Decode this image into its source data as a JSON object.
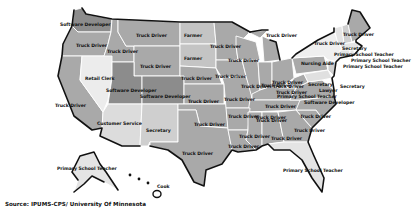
{
  "map": {
    "title": "",
    "type": "choropleth",
    "region": "United States",
    "colors": {
      "truck_driver": "#a9a9a9",
      "software_developer": "#8c8c8c",
      "farmer": "#c4c4c4",
      "retail_clerk": "#ececec",
      "customer_service": "#dcdcdc",
      "secretary": "#cfcfcf",
      "primary_school_teacher": "#e4e4e4",
      "nursing_aide": "#efefef",
      "cook": "#ffffff",
      "lawyer": "#e0e0e0",
      "background": "#ffffff",
      "coastline": "#111111"
    },
    "labels": [
      {
        "state": "Washington",
        "text": "Software Developer"
      },
      {
        "state": "Oregon",
        "text": "Truck Driver"
      },
      {
        "state": "Idaho",
        "text": "Truck Driver"
      },
      {
        "state": "Montana",
        "text": "Truck Driver"
      },
      {
        "state": "North Dakota",
        "text": "Farmer"
      },
      {
        "state": "South Dakota",
        "text": "Farmer"
      },
      {
        "state": "Minnesota",
        "text": "Truck Driver"
      },
      {
        "state": "Wisconsin",
        "text": "Truck Driver"
      },
      {
        "state": "Michigan",
        "text": "Truck Driver"
      },
      {
        "state": "Wyoming",
        "text": "Truck Driver"
      },
      {
        "state": "Nevada",
        "text": "Retail Clerk"
      },
      {
        "state": "Utah",
        "text": "Software Developer"
      },
      {
        "state": "Colorado",
        "text": "Software Developer"
      },
      {
        "state": "California",
        "text": "Truck Driver"
      },
      {
        "state": "Arizona",
        "text": "Customer Service"
      },
      {
        "state": "New Mexico",
        "text": "Secretary"
      },
      {
        "state": "Nebraska",
        "text": "Truck Driver"
      },
      {
        "state": "Iowa",
        "text": "Truck Driver"
      },
      {
        "state": "Illinois",
        "text": "Truck Driver"
      },
      {
        "state": "Indiana",
        "text": "Truck Driver"
      },
      {
        "state": "Ohio",
        "text": "Truck Driver"
      },
      {
        "state": "Kansas",
        "text": "Truck Driver"
      },
      {
        "state": "Missouri",
        "text": "Truck Driver"
      },
      {
        "state": "Kentucky",
        "text": "Truck Driver"
      },
      {
        "state": "West Virginia",
        "text": "Truck Driver"
      },
      {
        "state": "Oklahoma",
        "text": "Truck Driver"
      },
      {
        "state": "Arkansas",
        "text": "Truck Driver"
      },
      {
        "state": "Tennessee",
        "text": "Truck Driver"
      },
      {
        "state": "North Carolina",
        "text": "Truck Driver"
      },
      {
        "state": "South Carolina",
        "text": "Truck Driver"
      },
      {
        "state": "Texas",
        "text": "Truck Driver"
      },
      {
        "state": "Louisiana",
        "text": "Truck Driver"
      },
      {
        "state": "Mississippi",
        "text": "Truck Driver"
      },
      {
        "state": "Alabama",
        "text": "Truck Driver"
      },
      {
        "state": "Georgia",
        "text": "Truck Driver"
      },
      {
        "state": "Florida",
        "text": "Primary School Teacher"
      },
      {
        "state": "Pennsylvania",
        "text": "Truck Driver"
      },
      {
        "state": "New York",
        "text": "Nursing Aide"
      },
      {
        "state": "New Jersey",
        "text": "Secretary"
      },
      {
        "state": "Delaware",
        "text": "Secretary"
      },
      {
        "state": "Maryland",
        "text": "Lawyer"
      },
      {
        "state": "Virginia",
        "text": "Primary School Teacher"
      },
      {
        "state": "District of Columbia",
        "text": "Software Developer"
      },
      {
        "state": "Maine",
        "text": "Truck Driver"
      },
      {
        "state": "Vermont",
        "text": "Truck Driver"
      },
      {
        "state": "New Hampshire",
        "text": "Secretary"
      },
      {
        "state": "Massachusetts",
        "text": "Primary School Teacher"
      },
      {
        "state": "Rhode Island",
        "text": "Primary School Teacher"
      },
      {
        "state": "Connecticut",
        "text": "Primary School Teacher"
      },
      {
        "state": "Alaska",
        "text": "Primary School Teacher"
      },
      {
        "state": "Hawaii",
        "text": "Cook"
      }
    ],
    "source": "Source: IPUMS-CPS/ University Of Minnesota"
  }
}
